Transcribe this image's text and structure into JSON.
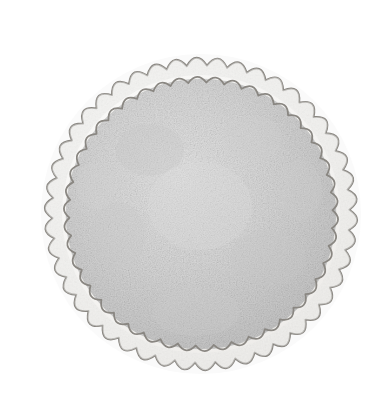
{
  "canvas": {
    "width": 390,
    "height": 418,
    "background_color": "#ffffff",
    "title": "Whole pie, top view, scored into quarters"
  },
  "illustration": {
    "subject_name": "pie",
    "style": "soft pencil / watercolor sketch, grayscale",
    "description": "A round pie seen from directly above. A wide fluted crimped crust ring surrounds a mottled gray filling surface. Two faint score lines (one vertical, one horizontal) cross at the center, dividing the pie into four equal quarters.",
    "palette": {
      "outline_stroke": "#8a8782",
      "crust_band_fill": "#f2f1ef",
      "crust_band_highlight": "#fbfbfa",
      "filling_fill": "#d6d6d6",
      "filling_shadow": "#c4c4c4",
      "filling_highlight": "#e6e6e6",
      "score_line": "#8e8b86",
      "paper_background": "#ffffff"
    },
    "geometry": {
      "center_x": 201,
      "center_y": 214,
      "outer_crust_radius": 159,
      "inner_crust_radius": 139,
      "filling_radius": 135,
      "scallop_count": 46,
      "scallop_depth": 7,
      "outline_width": 1.9,
      "score_line_width": 1.6
    },
    "elements": [
      {
        "name": "outer-crust-scallop-ring",
        "label": "Fluted outer crust edge"
      },
      {
        "name": "inner-crust-scallop-ring",
        "label": "Inner crimp line of crust"
      },
      {
        "name": "pie-filling-surface",
        "label": "Mottled pie filling top"
      },
      {
        "name": "vertical-score-line",
        "label": "Vertical cut line"
      },
      {
        "name": "horizontal-score-line",
        "label": "Horizontal cut line"
      }
    ],
    "score_lines": [
      {
        "name": "vertical",
        "x1": 201,
        "y1": 58,
        "x2": 201,
        "y2": 372
      },
      {
        "name": "horizontal",
        "x1": 46,
        "y1": 216,
        "x2": 352,
        "y2": 216
      }
    ]
  }
}
